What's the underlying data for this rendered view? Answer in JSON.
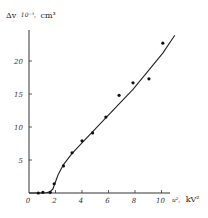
{
  "chart_data": {
    "type": "scatter",
    "title": "",
    "ylabel": "Δv 10⁻³ cm³",
    "ylabel_parts": {
      "symbol": "Δv",
      "scale": "10⁻³,",
      "unit": "cm³"
    },
    "xlabel": "u², kV²",
    "xlabel_parts": {
      "symbol": "u²,",
      "unit": "kV²"
    },
    "xlim": [
      0,
      11.5
    ],
    "ylim": [
      0,
      25
    ],
    "x_ticks": [
      0,
      2,
      4,
      6,
      8,
      10
    ],
    "x_tick_labels": [
      "0",
      "2",
      "4",
      "6",
      "8",
      "10"
    ],
    "y_ticks": [
      5,
      10,
      15,
      20
    ],
    "y_tick_labels": [
      "5",
      "10",
      "15",
      "20"
    ],
    "grid": false,
    "legend": null,
    "series": [
      {
        "name": "measured",
        "style": "points",
        "x": [
          0.7,
          1.05,
          1.6,
          1.9,
          2.6,
          3.25,
          4.0,
          4.8,
          5.8,
          6.8,
          7.85,
          9.05,
          10.1
        ],
        "y": [
          0.0,
          0.1,
          0.1,
          1.4,
          4.1,
          6.1,
          7.9,
          9.1,
          11.5,
          14.8,
          16.7,
          17.3,
          22.7
        ]
      },
      {
        "name": "fit curve",
        "style": "line",
        "x": [
          0.0,
          0.7,
          1.3,
          1.6,
          1.8,
          1.95,
          2.2,
          2.6,
          3.25,
          4.0,
          5.8,
          7.85,
          10.1,
          11.0
        ],
        "y": [
          0.0,
          0.0,
          0.05,
          0.2,
          0.6,
          1.4,
          2.8,
          4.3,
          6.0,
          7.6,
          11.4,
          15.7,
          21.2,
          23.9
        ]
      }
    ]
  }
}
